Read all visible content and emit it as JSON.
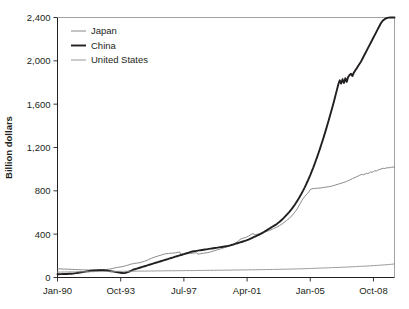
{
  "chart_data": {
    "type": "line",
    "title": "",
    "xlabel": "",
    "ylabel": "Billion dollars",
    "ylim": [
      0,
      2400
    ],
    "yticks": [
      0,
      400,
      800,
      1200,
      1600,
      2000,
      2400
    ],
    "ytick_labels": [
      "0",
      "400",
      "800",
      "1,200",
      "1,600",
      "2,000",
      "2,400"
    ],
    "xtick_labels": [
      "Jan-90",
      "Oct-93",
      "Jul-97",
      "Apr-01",
      "Jan-05",
      "Oct-08"
    ],
    "xtick_index": [
      0,
      45,
      90,
      135,
      180,
      225
    ],
    "x_start": "Jan-90",
    "x_end": "Dec-09",
    "x_count": 241,
    "grid": false,
    "legend_position": "top-left",
    "legend": [
      "Japan",
      "China",
      "United States"
    ],
    "series": [
      {
        "name": "Japan",
        "color": "#7a7a7a",
        "width": 0.9,
        "values": [
          80,
          80,
          80,
          79,
          78,
          78,
          77,
          77,
          76,
          76,
          75,
          75,
          74,
          73,
          73,
          72,
          72,
          71,
          71,
          70,
          70,
          70,
          70,
          70,
          70,
          70,
          70,
          70,
          70,
          71,
          71,
          72,
          72,
          73,
          73,
          74,
          76,
          78,
          80,
          83,
          86,
          89,
          92,
          94,
          96,
          98,
          100,
          103,
          106,
          110,
          114,
          118,
          122,
          125,
          128,
          130,
          132,
          134,
          136,
          138,
          142,
          146,
          150,
          155,
          160,
          166,
          172,
          178,
          183,
          188,
          192,
          196,
          200,
          204,
          208,
          212,
          216,
          219,
          221,
          222,
          223,
          224,
          225,
          226,
          228,
          230,
          233,
          236,
          208,
          210,
          213,
          216,
          219,
          221,
          222,
          223,
          224,
          226,
          228,
          230,
          215,
          218,
          220,
          222,
          224,
          226,
          228,
          230,
          233,
          236,
          240,
          244,
          248,
          252,
          256,
          260,
          264,
          268,
          272,
          276,
          280,
          285,
          290,
          295,
          300,
          305,
          312,
          320,
          330,
          340,
          350,
          358,
          362,
          366,
          370,
          375,
          382,
          390,
          398,
          404,
          400,
          396,
          398,
          402,
          406,
          410,
          414,
          418,
          422,
          426,
          430,
          435,
          440,
          446,
          452,
          458,
          464,
          470,
          478,
          486,
          495,
          505,
          515,
          525,
          535,
          545,
          558,
          572,
          588,
          604,
          620,
          640,
          662,
          686,
          710,
          730,
          748,
          762,
          775,
          790,
          812,
          818,
          820,
          822,
          823,
          824,
          825,
          826,
          828,
          830,
          832,
          834,
          836,
          838,
          840,
          843,
          846,
          850,
          854,
          858,
          862,
          866,
          870,
          874,
          878,
          882,
          888,
          894,
          900,
          906,
          912,
          918,
          924,
          930,
          936,
          942,
          948,
          952,
          948,
          955,
          962,
          958,
          966,
          974,
          970,
          978,
          986,
          982,
          990,
          996,
          1000,
          1004,
          1008,
          1006,
          1010,
          1014,
          1012,
          1016,
          1018,
          1020,
          1018
        ]
      },
      {
        "name": "China",
        "color": "#231f20",
        "width": 1.9,
        "values": [
          30,
          30,
          31,
          31,
          32,
          32,
          33,
          33,
          34,
          34,
          35,
          36,
          38,
          40,
          42,
          44,
          46,
          48,
          50,
          52,
          54,
          56,
          58,
          60,
          62,
          63,
          64,
          65,
          66,
          67,
          68,
          68,
          68,
          67,
          66,
          65,
          62,
          60,
          58,
          56,
          54,
          52,
          50,
          48,
          46,
          44,
          42,
          40,
          42,
          46,
          50,
          55,
          60,
          66,
          72,
          76,
          80,
          84,
          88,
          92,
          96,
          100,
          104,
          108,
          112,
          116,
          120,
          124,
          128,
          132,
          136,
          140,
          144,
          148,
          152,
          156,
          160,
          164,
          168,
          172,
          176,
          180,
          184,
          188,
          192,
          196,
          200,
          204,
          208,
          212,
          216,
          220,
          224,
          228,
          232,
          236,
          240,
          242,
          244,
          246,
          248,
          250,
          252,
          254,
          256,
          258,
          260,
          262,
          264,
          266,
          268,
          270,
          272,
          274,
          276,
          278,
          280,
          282,
          284,
          286,
          288,
          290,
          293,
          296,
          300,
          304,
          308,
          312,
          316,
          320,
          324,
          328,
          332,
          336,
          340,
          345,
          350,
          356,
          362,
          368,
          374,
          380,
          386,
          392,
          398,
          404,
          412,
          420,
          428,
          436,
          444,
          452,
          460,
          468,
          476,
          484,
          492,
          502,
          512,
          524,
          536,
          548,
          562,
          576,
          590,
          604,
          620,
          636,
          654,
          672,
          692,
          712,
          734,
          756,
          780,
          804,
          830,
          858,
          886,
          916,
          946,
          978,
          1010,
          1044,
          1080,
          1116,
          1154,
          1192,
          1232,
          1272,
          1314,
          1356,
          1400,
          1444,
          1490,
          1536,
          1584,
          1632,
          1682,
          1732,
          1784,
          1820,
          1790,
          1830,
          1796,
          1840,
          1806,
          1850,
          1870,
          1880,
          1860,
          1890,
          1910,
          1930,
          1950,
          1970,
          1990,
          2015,
          2040,
          2065,
          2090,
          2115,
          2140,
          2165,
          2190,
          2215,
          2240,
          2265,
          2290,
          2315,
          2340,
          2360,
          2375,
          2385,
          2392,
          2396,
          2399,
          2400,
          2400,
          2400,
          2400
        ]
      },
      {
        "name": "United States",
        "color": "#8c8c8c",
        "width": 0.9,
        "values": [
          50,
          50,
          50,
          50,
          51,
          51,
          51,
          51,
          52,
          52,
          52,
          52,
          52,
          52,
          53,
          53,
          53,
          53,
          53,
          53,
          54,
          54,
          54,
          54,
          54,
          54,
          54,
          55,
          55,
          55,
          55,
          55,
          55,
          55,
          56,
          56,
          56,
          56,
          56,
          56,
          56,
          57,
          57,
          57,
          57,
          57,
          57,
          57,
          58,
          58,
          58,
          58,
          58,
          58,
          58,
          58,
          59,
          59,
          59,
          59,
          59,
          59,
          59,
          60,
          60,
          60,
          60,
          60,
          60,
          60,
          61,
          61,
          61,
          61,
          61,
          61,
          61,
          62,
          62,
          62,
          62,
          62,
          62,
          62,
          63,
          63,
          63,
          63,
          63,
          63,
          63,
          64,
          64,
          64,
          64,
          64,
          64,
          64,
          65,
          65,
          65,
          65,
          65,
          65,
          65,
          66,
          66,
          66,
          66,
          66,
          66,
          66,
          67,
          67,
          67,
          67,
          67,
          67,
          68,
          68,
          68,
          68,
          68,
          68,
          69,
          69,
          69,
          69,
          69,
          69,
          70,
          70,
          70,
          70,
          70,
          70,
          71,
          71,
          71,
          71,
          71,
          72,
          72,
          72,
          72,
          72,
          73,
          73,
          73,
          73,
          73,
          74,
          74,
          74,
          74,
          75,
          75,
          75,
          75,
          76,
          76,
          76,
          76,
          77,
          77,
          77,
          78,
          78,
          78,
          79,
          79,
          79,
          80,
          80,
          80,
          81,
          81,
          82,
          82,
          83,
          83,
          84,
          84,
          85,
          85,
          86,
          86,
          87,
          87,
          88,
          88,
          89,
          89,
          90,
          90,
          91,
          91,
          92,
          92,
          93,
          93,
          94,
          94,
          95,
          95,
          96,
          96,
          97,
          98,
          98,
          99,
          100,
          100,
          101,
          102,
          102,
          103,
          104,
          104,
          105,
          106,
          106,
          107,
          108,
          109,
          110,
          110,
          111,
          112,
          113,
          114,
          115,
          116,
          117,
          118,
          119,
          120,
          121,
          122,
          124,
          125
        ]
      }
    ]
  }
}
